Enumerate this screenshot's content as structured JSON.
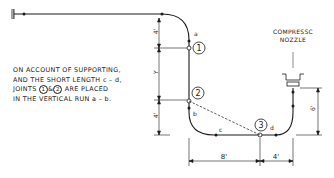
{
  "diagram": {
    "note": {
      "line1": "ON ACCOUNT OF SUPPORTING,",
      "line2": "AND THE SHORT LENGTH c – d,",
      "line3_pre": "JOINTS",
      "line3_joint1": "1",
      "line3_amp": "&",
      "line3_joint2": "2",
      "line3_post": "ARE PLACED",
      "line4": "IN THE VERTICAL RUN a – b."
    },
    "nozzle_label": {
      "line1": "COMPRESSC",
      "line2": "NOZZLE"
    },
    "points": {
      "a": "a",
      "b": "b",
      "c": "c",
      "d": "d"
    },
    "joints": {
      "j1": "1",
      "j2": "2",
      "j3": "3"
    },
    "dimensions": {
      "top_vertical": "4'",
      "middle_vertical": "Y",
      "lower_vertical": "4'",
      "right_vertical": "6'",
      "horizontal_left": "8'",
      "horizontal_right": "4'"
    },
    "colors": {
      "line": "#1a1a1a",
      "background": "#ffffff"
    }
  }
}
